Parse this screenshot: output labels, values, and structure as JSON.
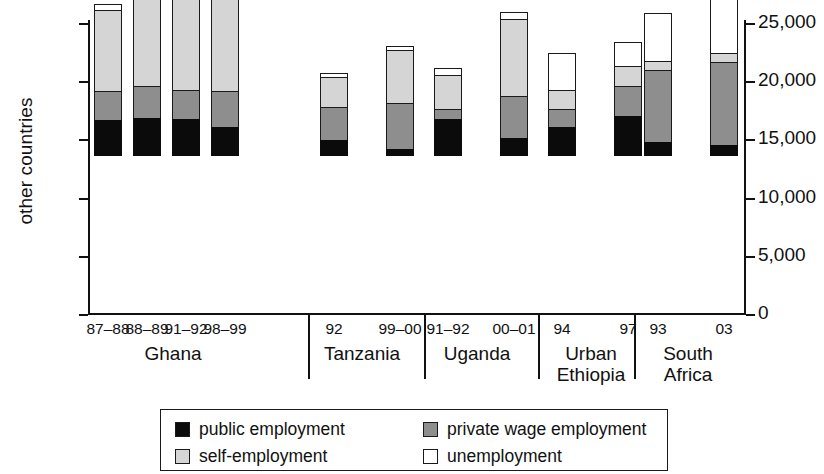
{
  "chart_data": {
    "type": "bar",
    "subtype": "stacked",
    "title": "",
    "xlabel": "",
    "ylabel": "other countries",
    "ylabel_right": "Ethiopia and South Africa",
    "ylim": [
      0,
      5000
    ],
    "ylim_right": [
      0,
      25000
    ],
    "yticks": [
      "0",
      "1,000",
      "2,000",
      "3,000",
      "4,000",
      "5,000"
    ],
    "ytick_values": [
      0,
      1000,
      2000,
      3000,
      4000,
      5000
    ],
    "yticks_right": [
      "0",
      "5,000",
      "10,000",
      "15,000",
      "20,000",
      "25,000"
    ],
    "ytick_values_right": [
      0,
      5000,
      10000,
      15000,
      20000,
      25000
    ],
    "grid": false,
    "legend_position": "bottom",
    "series": [
      {
        "name": "public employment",
        "color": "#0b0b0b",
        "values": [
          619,
          653,
          636,
          498,
          275,
          120,
          636,
          309,
          498,
          687,
          241,
          189
        ]
      },
      {
        "name": "private wage employment",
        "color": "#8e8e8e",
        "values": [
          515,
          567,
          515,
          636,
          584,
          808,
          189,
          739,
          327,
          533,
          1254,
          1444
        ]
      },
      {
        "name": "self-employment",
        "color": "#d5d5d5",
        "values": [
          1409,
          1787,
          1907,
          2663,
          533,
          928,
          601,
          1341,
          343,
          361,
          172,
          173
        ]
      },
      {
        "name": "unemployment",
        "color": "#ffffff",
        "values": [
          120,
          155,
          275,
          310,
          86,
          86,
          138,
          137,
          653,
          429,
          842,
          1688
        ]
      }
    ],
    "groups": [
      {
        "name": "Ghana",
        "categories": [
          "87–88",
          "88–89",
          "91–92",
          "98–99"
        ],
        "axis": "left"
      },
      {
        "name": "Tanzania",
        "categories": [
          "92",
          "99–00"
        ],
        "axis": "left"
      },
      {
        "name": "Uganda",
        "categories": [
          "91–92",
          "00–01"
        ],
        "axis": "left"
      },
      {
        "name": "Urban Ethiopia",
        "categories": [
          "94",
          "97"
        ],
        "axis": "right"
      },
      {
        "name": "South Africa",
        "categories": [
          "93",
          "03"
        ],
        "axis": "right"
      }
    ],
    "categories": [
      "87–88",
      "88–89",
      "91–92",
      "98–99",
      "92",
      "99–00",
      "91–92",
      "00–01",
      "94",
      "97",
      "93",
      "03"
    ],
    "totals": [
      2663,
      3162,
      3333,
      4107,
      1478,
      1942,
      1564,
      2526,
      1821,
      2010,
      2509,
      3494
    ]
  },
  "legend": {
    "items": [
      {
        "label": "public employment",
        "swatch": "public"
      },
      {
        "label": "private wage employment",
        "swatch": "private"
      },
      {
        "label": "self-employment",
        "swatch": "self"
      },
      {
        "label": "unemployment",
        "swatch": "unemp"
      }
    ]
  },
  "group_labels": {
    "ghana": "Ghana",
    "tanzania": "Tanzania",
    "uganda": "Uganda",
    "ethiopia_line1": "Urban",
    "ethiopia_line2": "Ethiopia",
    "southafrica_line1": "South",
    "southafrica_line2": "Africa"
  }
}
